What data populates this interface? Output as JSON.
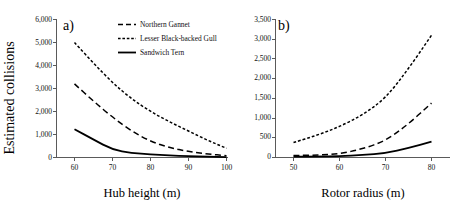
{
  "figure": {
    "ylabel": "Estimated collisions",
    "background_color": "#ffffff",
    "line_color": "#000000"
  },
  "legend": {
    "position": "top-right of panel a",
    "entries": [
      {
        "label": "Northern Gannet",
        "dash": "long-dash",
        "key": "northern_gannet"
      },
      {
        "label": "Lesser Black-backed Gull",
        "dash": "short-dash",
        "key": "lesser_black_backed_gull"
      },
      {
        "label": "Sandwich Tern",
        "dash": "solid",
        "key": "sandwich_tern"
      }
    ]
  },
  "chart_data": [
    {
      "panel": "a)",
      "type": "line",
      "title": "",
      "xlabel": "Hub height (m)",
      "ylabel": "Estimated collisions",
      "x": [
        60,
        65,
        70,
        75,
        80,
        85,
        90,
        95,
        100
      ],
      "xticks": [
        60,
        70,
        80,
        90,
        100
      ],
      "xticklabels": [
        "60",
        "70",
        "80",
        "90",
        "100"
      ],
      "xlim": [
        55,
        103
      ],
      "yticks": [
        0,
        1000,
        2000,
        3000,
        4000,
        5000,
        6000
      ],
      "yticklabels": [
        "0",
        "1,000",
        "2,000",
        "3,000",
        "4,000",
        "5,000",
        "6,000"
      ],
      "ylim": [
        0,
        6000
      ],
      "grid": false,
      "series": [
        {
          "name": "Lesser Black-backed Gull",
          "dash": "short-dash",
          "values": [
            5000,
            4100,
            3250,
            2550,
            2000,
            1550,
            1150,
            750,
            400
          ]
        },
        {
          "name": "Northern Gannet",
          "dash": "long-dash",
          "values": [
            3200,
            2450,
            1750,
            1150,
            700,
            430,
            260,
            150,
            80
          ]
        },
        {
          "name": "Sandwich Tern",
          "dash": "solid",
          "values": [
            1230,
            780,
            340,
            200,
            130,
            90,
            60,
            40,
            20
          ]
        }
      ]
    },
    {
      "panel": "b)",
      "type": "line",
      "title": "",
      "xlabel": "Rotor radius (m)",
      "ylabel": "Estimated collisions",
      "x": [
        50,
        55,
        60,
        65,
        70,
        75,
        80
      ],
      "xticks": [
        50,
        60,
        70,
        80
      ],
      "xticklabels": [
        "50",
        "60",
        "70",
        "80"
      ],
      "xlim": [
        46,
        84
      ],
      "yticks": [
        0,
        500,
        1000,
        1500,
        2000,
        2500,
        3000,
        3500
      ],
      "yticklabels": [
        "0",
        "500",
        "1,000",
        "1,500",
        "2,000",
        "2,500",
        "3,000",
        "3,500"
      ],
      "ylim": [
        0,
        3500
      ],
      "grid": false,
      "series": [
        {
          "name": "Lesser Black-backed Gull",
          "dash": "short-dash",
          "values": [
            380,
            560,
            780,
            1080,
            1500,
            2250,
            3100
          ]
        },
        {
          "name": "Northern Gannet",
          "dash": "long-dash",
          "values": [
            50,
            60,
            90,
            220,
            420,
            850,
            1380
          ]
        },
        {
          "name": "Sandwich Tern",
          "dash": "solid",
          "values": [
            20,
            25,
            35,
            60,
            110,
            240,
            400
          ]
        }
      ]
    }
  ]
}
